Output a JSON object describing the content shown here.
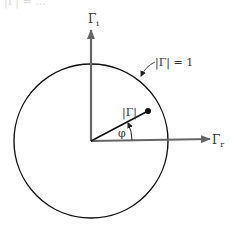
{
  "diagram": {
    "top_fragment": "|Γ| = ...",
    "axes": {
      "imag_label": "Γ",
      "imag_sub": "i",
      "real_label": "Γ",
      "real_sub": "r"
    },
    "unit_circle_label": "|Γ| = 1",
    "vector_label": "|Γ|",
    "angle_label": "φ",
    "colors": {
      "axis": "#666666",
      "circle": "#111111",
      "vector": "#111111"
    }
  }
}
